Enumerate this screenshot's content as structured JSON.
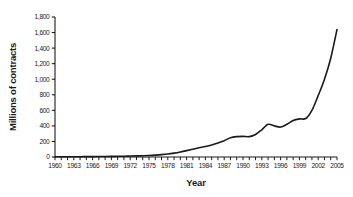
{
  "chart_data": {
    "type": "line",
    "title": "",
    "xlabel": "Year",
    "ylabel": "Millions of contracts",
    "xlim": [
      1960,
      2005
    ],
    "ylim": [
      0,
      1800
    ],
    "grid": false,
    "legend": "none",
    "line_color": "#1a1a1a",
    "axis_color": "#1a1a1a",
    "background_color": "#ffffff",
    "y_ticks": [
      0,
      200,
      400,
      600,
      800,
      1000,
      1200,
      1400,
      1600,
      1800
    ],
    "y_tick_labels": [
      "0",
      "200",
      "400",
      "600",
      "800",
      "1,000",
      "1,200",
      "1,400",
      "1,600",
      "1,800"
    ],
    "x_tick_labels": [
      "1960",
      "1963",
      "1966",
      "1969",
      "1972",
      "1975",
      "1978",
      "1981",
      "1984",
      "1987",
      "1990",
      "1993",
      "1996",
      "1999",
      "2002",
      "2005"
    ],
    "x_tick_label_years": [
      1960,
      1963,
      1966,
      1969,
      1972,
      1975,
      1978,
      1981,
      1984,
      1987,
      1990,
      1993,
      1996,
      1999,
      2002,
      2005
    ],
    "x_minor_tick_years": [
      1960,
      1961,
      1962,
      1963,
      1964,
      1965,
      1966,
      1967,
      1968,
      1969,
      1970,
      1971,
      1972,
      1973,
      1974,
      1975,
      1976,
      1977,
      1978,
      1979,
      1980,
      1981,
      1982,
      1983,
      1984,
      1985,
      1986,
      1987,
      1988,
      1989,
      1990,
      1991,
      1992,
      1993,
      1994,
      1995,
      1996,
      1997,
      1998,
      1999,
      2000,
      2001,
      2002,
      2003,
      2004,
      2005
    ],
    "x": [
      1960,
      1961,
      1962,
      1963,
      1964,
      1965,
      1966,
      1967,
      1968,
      1969,
      1970,
      1971,
      1972,
      1973,
      1974,
      1975,
      1976,
      1977,
      1978,
      1979,
      1980,
      1981,
      1982,
      1983,
      1984,
      1985,
      1986,
      1987,
      1988,
      1989,
      1990,
      1991,
      1992,
      1993,
      1994,
      1995,
      1996,
      1997,
      1998,
      1999,
      2000,
      2001,
      2002,
      2003,
      2004,
      2005
    ],
    "values": [
      3,
      3,
      3,
      4,
      4,
      5,
      5,
      6,
      7,
      8,
      9,
      10,
      12,
      14,
      16,
      19,
      24,
      30,
      38,
      50,
      65,
      82,
      100,
      118,
      135,
      155,
      180,
      210,
      248,
      262,
      265,
      262,
      290,
      350,
      420,
      400,
      385,
      420,
      470,
      490,
      495,
      600,
      790,
      1000,
      1270,
      1640
    ],
    "series": [
      {
        "name": "Contracts traded",
        "values": [
          3,
          3,
          3,
          4,
          4,
          5,
          5,
          6,
          7,
          8,
          9,
          10,
          12,
          14,
          16,
          19,
          24,
          30,
          38,
          50,
          65,
          82,
          100,
          118,
          135,
          155,
          180,
          210,
          248,
          262,
          265,
          262,
          290,
          350,
          420,
          400,
          385,
          420,
          470,
          490,
          495,
          600,
          790,
          1000,
          1270,
          1640
        ]
      }
    ]
  },
  "plot_geometry": {
    "left": 55,
    "right": 337,
    "top": 17,
    "bottom": 157
  }
}
